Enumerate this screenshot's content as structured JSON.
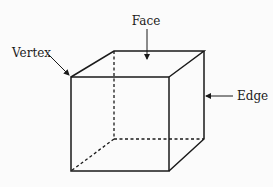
{
  "diagram": {
    "labels": {
      "face": "Face",
      "vertex": "Vertex",
      "edge": "Edge"
    },
    "colors": {
      "line": "#1a1a1a",
      "background": "#fbfbfb"
    }
  }
}
